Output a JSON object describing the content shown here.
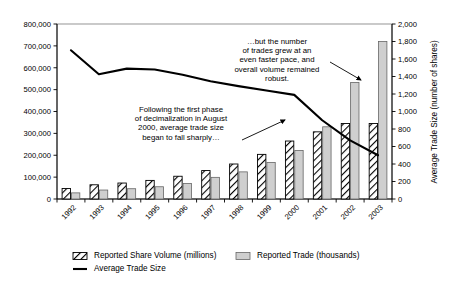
{
  "chart_data": {
    "type": "bar",
    "title": "",
    "subtitle": "",
    "xlabel": "",
    "ylabel": "",
    "ylabel_right": "Average Trade Size (number of shares)",
    "categories": [
      "1992",
      "1993",
      "1994",
      "1995",
      "1996",
      "1997",
      "1998",
      "1999",
      "2000",
      "2001",
      "2002",
      "2003"
    ],
    "ylim": [
      0,
      800000
    ],
    "ylim_right": [
      0,
      2000
    ],
    "ytick_labels": [
      "0",
      "100,000",
      "200,000",
      "300,000",
      "400,000",
      "500,000",
      "600,000",
      "700,000",
      "800,000"
    ],
    "ytick_values": [
      0,
      100000,
      200000,
      300000,
      400000,
      500000,
      600000,
      700000,
      800000
    ],
    "ytick_labels_right": [
      "0",
      "200",
      "400",
      "600",
      "800",
      "1,000",
      "1,200",
      "1,400",
      "1,600",
      "1,800",
      "2,000"
    ],
    "ytick_values_right": [
      0,
      200,
      400,
      600,
      800,
      1000,
      1200,
      1400,
      1600,
      1800,
      2000
    ],
    "grid": false,
    "legend_position": "bottom",
    "series": [
      {
        "name": "Reported Share Volume (millions)",
        "type": "bar",
        "axis": "left",
        "style": "diagonal-hatch",
        "values": [
          48000,
          65000,
          73000,
          85000,
          104000,
          130000,
          160000,
          204000,
          265000,
          307000,
          345000,
          345000
        ]
      },
      {
        "name": "Reported Trade (thousands)",
        "type": "bar",
        "axis": "left",
        "style": "solid-gray",
        "values": [
          28000,
          41000,
          47000,
          56000,
          71000,
          99000,
          124000,
          167000,
          222000,
          330000,
          533000,
          720000
        ]
      },
      {
        "name": "Average Trade Size",
        "type": "line",
        "axis": "right",
        "style": "solid-black-line",
        "values": [
          1700,
          1425,
          1490,
          1480,
          1420,
          1345,
          1290,
          1240,
          1190,
          900,
          670,
          500
        ]
      }
    ],
    "annotations": [
      {
        "id": "annotation-decimalization",
        "lines": [
          "Following the first phase",
          "of decimalization in August",
          "2000, average trade size",
          "began to fall sharply…"
        ],
        "arrow_to_category": "2000"
      },
      {
        "id": "annotation-trade-growth",
        "lines": [
          "…but the number",
          "of trades grew at an",
          "even faster pace, and",
          "overall volume remained",
          "robust."
        ],
        "arrow_to_category": "2003"
      }
    ],
    "legend": [
      {
        "label": "Reported Share Volume (millions)",
        "marker": "diagonal-hatch-swatch"
      },
      {
        "label": "Reported Trade (thousands)",
        "marker": "solid-gray-swatch"
      },
      {
        "label": "Average Trade Size",
        "marker": "line-swatch"
      }
    ],
    "colors": {
      "bar_hatch_fill": "#ffffff",
      "bar_hatch_stroke": "#000000",
      "bar_solid_fill": "#cfcfcf",
      "bar_solid_stroke": "#666666",
      "line": "#000000",
      "axis": "#000000",
      "plot_border": "#7a7a7a",
      "background": "#ffffff"
    }
  }
}
